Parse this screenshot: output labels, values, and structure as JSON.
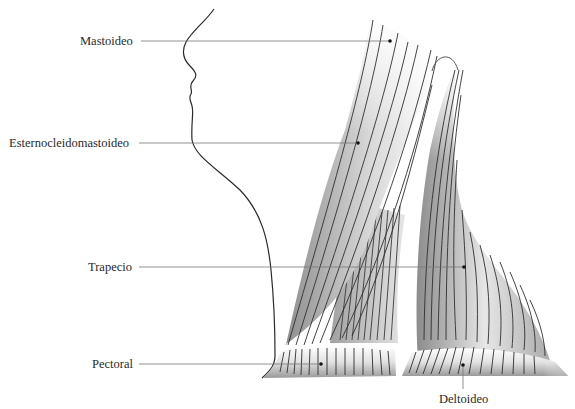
{
  "diagram": {
    "colors": {
      "line": "#2a2a2a",
      "leader": "#777777",
      "muscle_dark": "#9a9a9a",
      "muscle_light": "#ffffff"
    },
    "labels": [
      {
        "id": "mastoideo",
        "text": "Mastoideo"
      },
      {
        "id": "esternocleidomastoideo",
        "text": "Esternocleidomastoideo"
      },
      {
        "id": "trapecio",
        "text": "Trapecio"
      },
      {
        "id": "pectoral",
        "text": "Pectoral"
      },
      {
        "id": "deltoideo",
        "text": "Deltoideo"
      }
    ]
  }
}
